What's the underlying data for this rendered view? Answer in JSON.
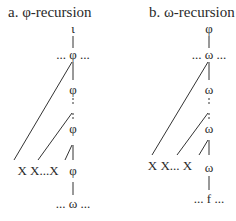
{
  "panels": [
    {
      "title": "a. φ-recursion",
      "nodes": {
        "top": "ι",
        "upper": "... φ ...",
        "mid1": "φ",
        "mid2": "φ",
        "bottom_row": "X  X...X",
        "bottom_head": "φ",
        "base": "... ω ..."
      }
    },
    {
      "title": "b. ω-recursion",
      "nodes": {
        "top": "φ",
        "upper": "... ω ...",
        "mid1": "ω",
        "mid2": "ω",
        "bottom_row": "X  X...  X",
        "bottom_head": "ω",
        "base": "... f ..."
      }
    }
  ]
}
